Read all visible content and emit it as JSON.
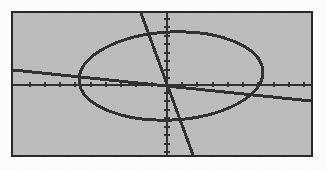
{
  "viewport": {
    "label": "graphing-calculator-plot",
    "background_color": "#bdbdbd",
    "border_color": "#2a2a2a",
    "page_background": "#fdfdfd",
    "curve_color": "#333333",
    "axis_color": "#333333",
    "frame": {
      "x": 11,
      "y": 11,
      "width": 302,
      "height": 146
    }
  },
  "chart_data": {
    "type": "line",
    "title": "",
    "subtitle": "",
    "xlabel": "",
    "ylabel": "",
    "grid": false,
    "legend": "none",
    "axes": {
      "x_axis_pixel_y": 72,
      "y_axis_pixel_x": 154,
      "x_tick_count": 20,
      "y_tick_count": 16,
      "x_tick_spacing_px": 15.2,
      "y_tick_spacing_px": 8.6,
      "tick_length_px": 4,
      "xlim": [
        -10,
        10
      ],
      "ylim": [
        -8,
        8
      ]
    },
    "series": [
      {
        "name": "ellipse",
        "type": "conic-ellipse",
        "center_x": 0.3,
        "center_y": 0.75,
        "radius_x": 6.1,
        "radius_y": 5.1,
        "center_pixel_x": 158,
        "center_pixel_y": 63,
        "radius_pixel_x": 92,
        "radius_pixel_y": 44,
        "rotation_deg": -3
      },
      {
        "name": "shallow-line",
        "type": "line",
        "slope": -0.74,
        "intercept": 2.3,
        "pixel_x1": 0,
        "pixel_y1": 57,
        "pixel_x2": 298,
        "pixel_y2": 88
      },
      {
        "name": "steep-line",
        "type": "line",
        "slope": -3.4,
        "intercept": 6.5,
        "pixel_x1": 128,
        "pixel_y1": 0,
        "pixel_x2": 180,
        "pixel_y2": 142
      }
    ],
    "x": [],
    "values": [],
    "categories": []
  }
}
